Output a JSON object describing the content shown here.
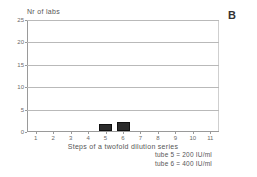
{
  "panel": {
    "label": "B"
  },
  "chart_data": {
    "type": "bar",
    "title": "",
    "xlabel": "Steps of a twofold dilution series",
    "ylabel": "Nr of labs",
    "categories": [
      "1",
      "2",
      "3",
      "4",
      "5",
      "6",
      "7",
      "8",
      "9",
      "10",
      "11"
    ],
    "values": [
      0,
      0,
      0,
      0,
      1.5,
      2,
      0,
      0,
      0,
      0,
      0
    ],
    "xlim": [
      0.5,
      11.5
    ],
    "ylim": [
      0,
      25
    ],
    "yticks": [
      0,
      5,
      10,
      15,
      20,
      25
    ],
    "ytick_labels": [
      "0",
      "5",
      "10",
      "15",
      "20",
      "25"
    ],
    "grid": "horizontal",
    "bar_color": "#2b2b2b",
    "legend_position": "below-right",
    "annotations": [
      "tube 5 = 200 IU/ml",
      "tube 6 = 400 IU/ml"
    ]
  },
  "legend": {
    "entries": [
      {
        "text": "tube 5 = 200 IU/ml"
      },
      {
        "text": "tube 6 = 400 IU/ml"
      }
    ]
  }
}
